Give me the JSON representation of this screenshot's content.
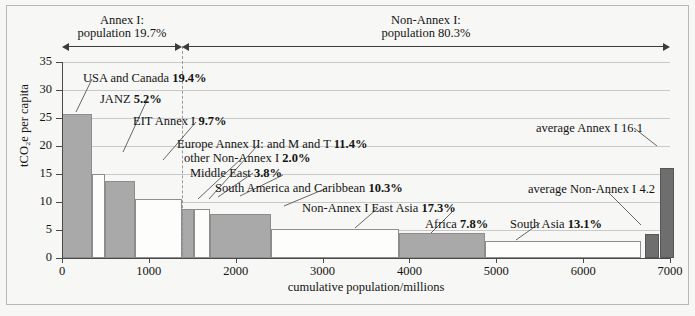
{
  "chart_data": {
    "type": "bar",
    "title": "",
    "xlabel": "cumulative population/millions",
    "ylabel": "tCO₂e per capita",
    "xlim": [
      0,
      7000
    ],
    "ylim": [
      0,
      35
    ],
    "xticks": [
      0,
      1000,
      2000,
      3000,
      4000,
      5000,
      6000,
      7000
    ],
    "yticks": [
      0,
      5,
      10,
      15,
      20,
      25,
      30,
      35
    ],
    "grid": "horizontal",
    "legend": "none",
    "note": "Variable-width bar chart: bar width = population (millions), bar height = tCO2e per capita. Percentages are share of global GHG emissions.",
    "bars": [
      {
        "name": "USA and Canada",
        "share": "19.4%",
        "x_start": 0,
        "x_end": 340,
        "population": 340,
        "value": 25.8,
        "fill": "dark",
        "group": "Annex I"
      },
      {
        "name": "JANZ",
        "share": "5.2%",
        "x_start": 340,
        "x_end": 500,
        "population": 160,
        "value": 15.0,
        "fill": "light",
        "group": "Annex I"
      },
      {
        "name": "EIT Annex I",
        "share": "9.7%",
        "x_start": 500,
        "x_end": 840,
        "population": 340,
        "value": 13.8,
        "fill": "dark",
        "group": "Annex I"
      },
      {
        "name": "Europe Annex II: and M and T",
        "share": "11.4%",
        "x_start": 840,
        "x_end": 1380,
        "population": 540,
        "value": 10.5,
        "fill": "light",
        "group": "Annex I"
      },
      {
        "name": "other Non-Annex I",
        "share": "2.0%",
        "x_start": 1380,
        "x_end": 1520,
        "population": 140,
        "value": 8.7,
        "fill": "dark",
        "group": "Non-Annex I"
      },
      {
        "name": "Middle East",
        "share": "3.8%",
        "x_start": 1520,
        "x_end": 1700,
        "population": 180,
        "value": 8.7,
        "fill": "light",
        "group": "Non-Annex I"
      },
      {
        "name": "South America and Caribbean",
        "share": "10.3%",
        "x_start": 1700,
        "x_end": 2410,
        "population": 710,
        "value": 7.9,
        "fill": "dark",
        "group": "Non-Annex I"
      },
      {
        "name": "Non-Annex I East Asia",
        "share": "17.3%",
        "x_start": 2410,
        "x_end": 3880,
        "population": 1470,
        "value": 5.2,
        "fill": "light",
        "group": "Non-Annex I"
      },
      {
        "name": "Africa",
        "share": "7.8%",
        "x_start": 3880,
        "x_end": 4870,
        "population": 990,
        "value": 4.5,
        "fill": "dark",
        "group": "Non-Annex I"
      },
      {
        "name": "South Asia",
        "share": "13.1%",
        "x_start": 4870,
        "x_end": 6670,
        "population": 1800,
        "value": 3.1,
        "fill": "light",
        "group": "Non-Annex I"
      }
    ],
    "average_bars": [
      {
        "name": "average Non-Annex I",
        "label": "average Non-Annex I 4.2",
        "value": 4.2,
        "x_center": 6790,
        "width_px": 14
      },
      {
        "name": "average Annex I",
        "label": "average Annex I 16.1",
        "value": 16.1,
        "x_center": 6960,
        "width_px": 14
      }
    ],
    "brackets": [
      {
        "name": "annex-i",
        "line1": "Annex I:",
        "line2": "population 19.7%",
        "x_start": 0,
        "x_end": 1380
      },
      {
        "name": "non-annex-i",
        "line1": "Non-Annex I:",
        "line2": "population 80.3%",
        "x_start": 1380,
        "x_end": 7000
      }
    ],
    "divider_x": 1380,
    "callouts": [
      {
        "key": "usa_canada",
        "text": "USA and Canada ",
        "bold": "19.4%"
      },
      {
        "key": "janz",
        "text": "JANZ ",
        "bold": "5.2%"
      },
      {
        "key": "eit",
        "text": "EIT Annex I ",
        "bold": "9.7%"
      },
      {
        "key": "europe",
        "text": "Europe Annex II: and M and T ",
        "bold": "11.4%"
      },
      {
        "key": "other_na1",
        "text": "other Non-Annex I ",
        "bold": "2.0%"
      },
      {
        "key": "middle_east",
        "text": "Middle East ",
        "bold": "3.8%"
      },
      {
        "key": "south_america",
        "text": "South America and Caribbean ",
        "bold": "10.3%"
      },
      {
        "key": "east_asia",
        "text": "Non-Annex I East Asia ",
        "bold": "17.3%"
      },
      {
        "key": "africa",
        "text": "Africa ",
        "bold": "7.8%"
      },
      {
        "key": "south_asia",
        "text": "South Asia ",
        "bold": "13.1%"
      },
      {
        "key": "avg_annex1",
        "text": "average Annex I 16.1",
        "bold": ""
      },
      {
        "key": "avg_nonannex1",
        "text": "average Non-Annex I 4.2",
        "bold": ""
      }
    ],
    "colors": {
      "bar_dark": "#a9a9a9",
      "bar_light": "#fdfdfb",
      "bar_average": "#6e6e6e",
      "bar_stroke": "#8d8d8d",
      "axis": "#4a4a4a",
      "grid": "#c9c9c9",
      "background": "#f7f7f5",
      "text": "#141414"
    }
  },
  "ytick_labels": [
    "0",
    "5",
    "10",
    "15",
    "20",
    "25",
    "30",
    "35"
  ],
  "xtick_labels": [
    "0",
    "1000",
    "2000",
    "3000",
    "4000",
    "5000",
    "6000",
    "7000"
  ]
}
